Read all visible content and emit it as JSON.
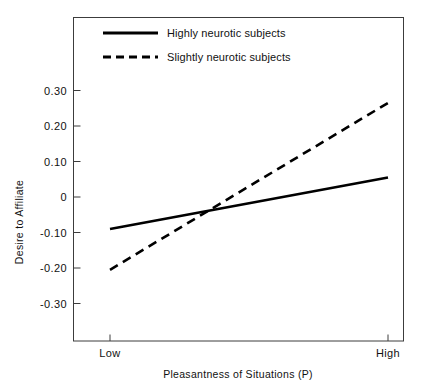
{
  "chart_data": {
    "type": "line",
    "title": "",
    "xlabel": "Pleasantness of Situations (P)",
    "ylabel": "Desire to Affiliate",
    "x": [
      "Low",
      "High"
    ],
    "xtick_labels": [
      "Low",
      "High"
    ],
    "ytick_labels": [
      "0.30",
      "0.20",
      "0.10",
      "0",
      "-0.10",
      "-0.20",
      "-0.30"
    ],
    "ytick_values": [
      0.3,
      0.2,
      0.1,
      0,
      -0.1,
      -0.2,
      -0.3
    ],
    "ylim": [
      -0.37,
      0.37
    ],
    "grid": false,
    "legend_position": "top-left-inside",
    "series": [
      {
        "name": "Highly neurotic subjects",
        "style": "solid",
        "color": "#000000",
        "values": [
          -0.09,
          0.055
        ]
      },
      {
        "name": "Slightly neurotic subjects",
        "style": "dashed",
        "color": "#000000",
        "values": [
          -0.205,
          0.265
        ]
      }
    ]
  },
  "axes": {
    "y_axis_title": "Desire to Affiliate",
    "x_axis_title": "Pleasantness of Situations (P)",
    "y_ticks": [
      {
        "label": "0.30",
        "value": 0.3
      },
      {
        "label": "0.20",
        "value": 0.2
      },
      {
        "label": "0.10",
        "value": 0.1
      },
      {
        "label": "0",
        "value": 0
      },
      {
        "label": "-0.10",
        "value": -0.1
      },
      {
        "label": "-0.20",
        "value": -0.2
      },
      {
        "label": "-0.30",
        "value": -0.3
      }
    ],
    "x_ticks": [
      {
        "label": "Low"
      },
      {
        "label": "High"
      }
    ]
  },
  "legend": {
    "items": [
      {
        "label": "Highly neurotic subjects",
        "style": "solid"
      },
      {
        "label": "Slightly neurotic subjects",
        "style": "dashed"
      }
    ]
  },
  "colors": {
    "line": "#000000",
    "frame": "#3c3c3c",
    "background": "#ffffff",
    "text": "#111111"
  }
}
